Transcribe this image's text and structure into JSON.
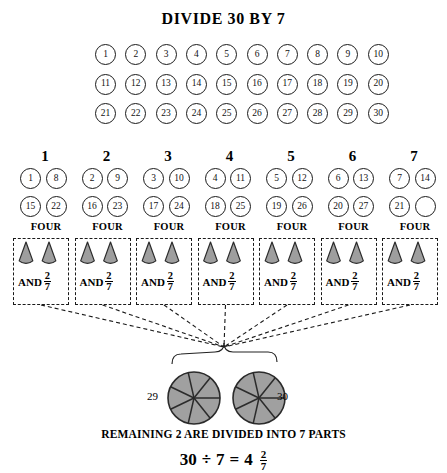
{
  "title": "DIVIDE 30 BY 7",
  "colors": {
    "ink": "#1a1a1a",
    "wedge_fill": "#9e9e9e",
    "wedge_stroke": "#2b2b2b",
    "pie_fill": "#a0a0a0",
    "pie_stroke": "#2b2b2b",
    "dashed": "#1a1a1a",
    "background": "#ffffff"
  },
  "grid": {
    "rows": [
      [
        "1",
        "2",
        "3",
        "4",
        "5",
        "6",
        "7",
        "8",
        "9",
        "10"
      ],
      [
        "11",
        "12",
        "13",
        "14",
        "15",
        "16",
        "17",
        "18",
        "19",
        "20"
      ],
      [
        "21",
        "22",
        "23",
        "24",
        "25",
        "26",
        "27",
        "28",
        "29",
        "30"
      ]
    ]
  },
  "groups": [
    {
      "header": "1",
      "cells": [
        "1",
        "8",
        "15",
        "22"
      ],
      "four_label": "FOUR",
      "and_label": "AND",
      "frac_num": "2",
      "frac_den": "7"
    },
    {
      "header": "2",
      "cells": [
        "2",
        "9",
        "16",
        "23"
      ],
      "four_label": "FOUR",
      "and_label": "AND",
      "frac_num": "2",
      "frac_den": "7"
    },
    {
      "header": "3",
      "cells": [
        "3",
        "10",
        "17",
        "24"
      ],
      "four_label": "FOUR",
      "and_label": "AND",
      "frac_num": "2",
      "frac_den": "7"
    },
    {
      "header": "4",
      "cells": [
        "4",
        "11",
        "18",
        "25"
      ],
      "four_label": "FOUR",
      "and_label": "AND",
      "frac_num": "2",
      "frac_den": "7"
    },
    {
      "header": "5",
      "cells": [
        "5",
        "12",
        "19",
        "26"
      ],
      "four_label": "FOUR",
      "and_label": "AND",
      "frac_num": "2",
      "frac_den": "7"
    },
    {
      "header": "6",
      "cells": [
        "6",
        "13",
        "20",
        "27"
      ],
      "four_label": "FOUR",
      "and_label": "AND",
      "frac_num": "2",
      "frac_den": "7"
    },
    {
      "header": "7",
      "cells": [
        "7",
        "14",
        "21",
        ""
      ],
      "four_label": "FOUR",
      "and_label": "AND",
      "frac_num": "2",
      "frac_den": "7"
    }
  ],
  "pies": {
    "sectors": 7,
    "left_label": "29",
    "right_label": "30"
  },
  "footer": {
    "remaining_text": "REMAINING 2 ARE DIVIDED INTO 7 PARTS",
    "equation": {
      "dividend": "30",
      "divide_sign": "÷",
      "divisor": "7",
      "equals": "=",
      "quotient": "4",
      "frac_num": "2",
      "frac_den": "7"
    }
  }
}
